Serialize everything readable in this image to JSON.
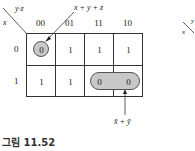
{
  "kmap": {
    "row_var": "x",
    "col_var": "y·z",
    "columns": [
      "00",
      "01",
      "11",
      "10"
    ],
    "rows": [
      {
        "label": "0",
        "cells": [
          "0",
          "1",
          "1",
          "1"
        ]
      },
      {
        "label": "1",
        "cells": [
          "1",
          "1",
          "0",
          "0"
        ]
      }
    ],
    "groups": [
      {
        "label": "x + y + z",
        "cells": [
          [
            0,
            0
          ]
        ]
      },
      {
        "label": "x̄ + ȳ",
        "cells": [
          [
            1,
            2
          ],
          [
            1,
            3
          ]
        ]
      }
    ]
  },
  "partial_map": {
    "row_var": "x",
    "col_var": "y"
  },
  "caption": "그림 11.52"
}
